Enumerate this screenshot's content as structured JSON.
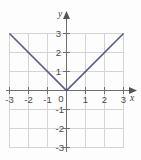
{
  "chart_data": {
    "type": "line",
    "title": "",
    "xlabel": "x",
    "ylabel": "y",
    "xlim": [
      -3,
      3
    ],
    "ylim": [
      -3,
      3
    ],
    "grid": true,
    "legend": false,
    "x_ticks": [
      "-3",
      "-2",
      "-1",
      "0",
      "1",
      "2",
      "3"
    ],
    "y_ticks": [
      "3",
      "2",
      "1",
      "0",
      "-1",
      "-2",
      "-3"
    ],
    "x_tick_values": [
      -3,
      -2,
      -1,
      0,
      1,
      2,
      3
    ],
    "y_tick_values": [
      3,
      2,
      1,
      0,
      -1,
      -2,
      -3
    ],
    "series": [
      {
        "name": "y = |x|",
        "color": "#555a86",
        "x": [
          -3,
          0,
          3
        ],
        "values": [
          3,
          0,
          3
        ]
      }
    ],
    "origin_label": "0",
    "axis_color": "#6e6e6e",
    "grid_color": "#d6d6d6",
    "background": "#fdfdfd"
  },
  "labels": {
    "x_neg3": "-3",
    "x_neg2": "-2",
    "x_neg1": "-1",
    "origin": "0",
    "x_pos1": "1",
    "x_pos2": "2",
    "x_pos3": "3",
    "y_pos3": "3",
    "y_pos2": "2",
    "y_pos1": "1",
    "y_neg1": "-1",
    "y_neg2": "-2",
    "y_neg3": "-3",
    "axis_x_name": "x",
    "axis_y_name": "y"
  }
}
